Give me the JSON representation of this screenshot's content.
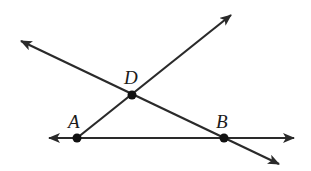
{
  "diagram": {
    "stroke_color": "#2a2a2a",
    "point_color": "#111111",
    "points": {
      "A": {
        "label": "A",
        "x": 77,
        "y": 138,
        "label_x": 68,
        "label_y": 128
      },
      "D": {
        "label": "D",
        "x": 132,
        "y": 95,
        "label_x": 124,
        "label_y": 84
      },
      "B": {
        "label": "B",
        "x": 224,
        "y": 138,
        "label_x": 216,
        "label_y": 128
      }
    },
    "lines": [
      {
        "name": "line-AB",
        "through": [
          "A",
          "B"
        ],
        "x1": 49,
        "y1": 138,
        "x2": 294,
        "y2": 138
      },
      {
        "name": "line-AD",
        "through": [
          "A",
          "D"
        ],
        "x1": 77,
        "y1": 138,
        "x2": 231,
        "y2": 15,
        "arrow_start": false
      },
      {
        "name": "line-DB",
        "through": [
          "D",
          "B"
        ],
        "x1": 21,
        "y1": 41,
        "x2": 279,
        "y2": 164
      }
    ]
  }
}
